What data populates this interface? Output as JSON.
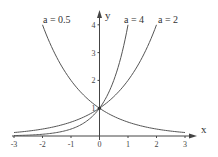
{
  "chart_data": {
    "type": "line",
    "title": "",
    "xlabel": "x",
    "ylabel": "y",
    "xlim": [
      -3,
      3
    ],
    "ylim": [
      0,
      4
    ],
    "grid": false,
    "x_ticks": [
      "-3",
      "-2",
      "-1",
      "0",
      "1",
      "2",
      "3"
    ],
    "y_ticks": [
      "1",
      "2",
      "3",
      "4"
    ],
    "function": "y = a^x",
    "series": [
      {
        "name": "a = 0.5",
        "base": 0.5,
        "x_range": [
          -2,
          3
        ]
      },
      {
        "name": "a = 4",
        "base": 4,
        "x_range": [
          -3,
          1
        ]
      },
      {
        "name": "a = 2",
        "base": 2,
        "x_range": [
          -3,
          2
        ]
      }
    ],
    "intersection": {
      "x": 0,
      "y": 1
    }
  },
  "labels": {
    "x_axis": "x",
    "y_axis": "y",
    "series_0": "a = 0.5",
    "series_1": "a = 4",
    "series_2": "a = 2"
  }
}
